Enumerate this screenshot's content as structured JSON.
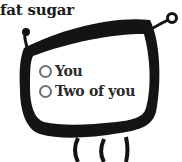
{
  "brand": {
    "title": "fat sugar"
  },
  "poll": {
    "options": [
      {
        "label": "You",
        "selected": false
      },
      {
        "label": "Two of you",
        "selected": false
      }
    ]
  },
  "colors": {
    "frame": "#141414",
    "radio_ring": "#6f6f6f",
    "text": "#2a2a2a",
    "background": "#ffffff"
  }
}
